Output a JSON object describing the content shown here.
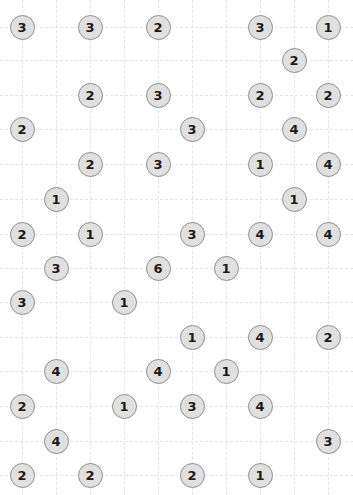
{
  "chart_data": {
    "type": "scatter",
    "title": "",
    "xlabel": "",
    "ylabel": "",
    "xlim": [
      0,
      353
    ],
    "ylim": [
      0,
      495
    ],
    "grid": true,
    "grid_style": "dashed",
    "grid_color": "#e4e4e4",
    "legend": "none",
    "marker": {
      "shape": "circle",
      "diameter_px": 25,
      "fill": "#e0e0e0",
      "edge": "#8f8f8f",
      "label_color": "#1a1a1a"
    },
    "grid_x": [
      22,
      56,
      90,
      124,
      158,
      192,
      226,
      260,
      294,
      328
    ],
    "grid_y": [
      27,
      60,
      95,
      129,
      164,
      199,
      234,
      268,
      302,
      337,
      371,
      406,
      441,
      475
    ],
    "points": [
      {
        "x": 22,
        "y": 27,
        "label": "3"
      },
      {
        "x": 90,
        "y": 27,
        "label": "3"
      },
      {
        "x": 158,
        "y": 27,
        "label": "2"
      },
      {
        "x": 260,
        "y": 27,
        "label": "3"
      },
      {
        "x": 328,
        "y": 27,
        "label": "1"
      },
      {
        "x": 294,
        "y": 60,
        "label": "2"
      },
      {
        "x": 90,
        "y": 95,
        "label": "2"
      },
      {
        "x": 158,
        "y": 95,
        "label": "3"
      },
      {
        "x": 260,
        "y": 95,
        "label": "2"
      },
      {
        "x": 328,
        "y": 95,
        "label": "2"
      },
      {
        "x": 22,
        "y": 129,
        "label": "2"
      },
      {
        "x": 192,
        "y": 129,
        "label": "3"
      },
      {
        "x": 294,
        "y": 129,
        "label": "4"
      },
      {
        "x": 90,
        "y": 164,
        "label": "2"
      },
      {
        "x": 158,
        "y": 164,
        "label": "3"
      },
      {
        "x": 260,
        "y": 164,
        "label": "1"
      },
      {
        "x": 328,
        "y": 164,
        "label": "4"
      },
      {
        "x": 56,
        "y": 199,
        "label": "1"
      },
      {
        "x": 294,
        "y": 199,
        "label": "1"
      },
      {
        "x": 22,
        "y": 234,
        "label": "2"
      },
      {
        "x": 90,
        "y": 234,
        "label": "1"
      },
      {
        "x": 192,
        "y": 234,
        "label": "3"
      },
      {
        "x": 260,
        "y": 234,
        "label": "4"
      },
      {
        "x": 328,
        "y": 234,
        "label": "4"
      },
      {
        "x": 56,
        "y": 268,
        "label": "3"
      },
      {
        "x": 158,
        "y": 268,
        "label": "6"
      },
      {
        "x": 226,
        "y": 268,
        "label": "1"
      },
      {
        "x": 22,
        "y": 302,
        "label": "3"
      },
      {
        "x": 124,
        "y": 302,
        "label": "1"
      },
      {
        "x": 192,
        "y": 337,
        "label": "1"
      },
      {
        "x": 260,
        "y": 337,
        "label": "4"
      },
      {
        "x": 328,
        "y": 337,
        "label": "2"
      },
      {
        "x": 56,
        "y": 371,
        "label": "4"
      },
      {
        "x": 158,
        "y": 371,
        "label": "4"
      },
      {
        "x": 226,
        "y": 371,
        "label": "1"
      },
      {
        "x": 22,
        "y": 406,
        "label": "2"
      },
      {
        "x": 124,
        "y": 406,
        "label": "1"
      },
      {
        "x": 192,
        "y": 406,
        "label": "3"
      },
      {
        "x": 260,
        "y": 406,
        "label": "4"
      },
      {
        "x": 56,
        "y": 441,
        "label": "4"
      },
      {
        "x": 328,
        "y": 441,
        "label": "3"
      },
      {
        "x": 22,
        "y": 475,
        "label": "2"
      },
      {
        "x": 90,
        "y": 475,
        "label": "2"
      },
      {
        "x": 192,
        "y": 475,
        "label": "2"
      },
      {
        "x": 260,
        "y": 475,
        "label": "1"
      }
    ]
  }
}
